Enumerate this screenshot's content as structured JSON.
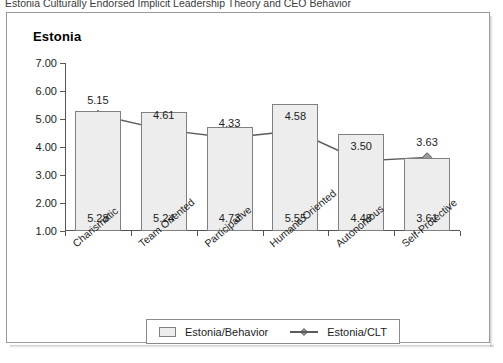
{
  "caption": "Estonia Culturally Endorsed Implicit Leadership Theory and CEO Behavior",
  "chart_data": {
    "type": "bar",
    "title": "Estonia",
    "xlabel": "",
    "ylabel": "",
    "ylim": [
      1.0,
      7.0
    ],
    "ytick_labels": [
      "7.00",
      "6.00",
      "5.00",
      "4.00",
      "3.00",
      "2.00",
      "1.00"
    ],
    "ytick_values": [
      7.0,
      6.0,
      5.0,
      4.0,
      3.0,
      2.0,
      1.0
    ],
    "grid": false,
    "legend_position": "bottom",
    "categories": [
      "Charismatic",
      "Team Oriented",
      "Participative",
      "Humane Oriented",
      "Autonomous",
      "Self-Protective"
    ],
    "series": [
      {
        "name": "Estonia/Behavior",
        "type": "bar",
        "values": [
          5.28,
          5.24,
          4.73,
          5.55,
          4.48,
          3.61
        ],
        "labels": [
          "5.28",
          "5.24",
          "4.73",
          "5.55",
          "4.48",
          "3.61"
        ],
        "fill_color": "#ededed",
        "border_color": "#808080"
      },
      {
        "name": "Estonia/CLT",
        "type": "line",
        "values": [
          5.15,
          4.61,
          4.33,
          4.58,
          3.5,
          3.63
        ],
        "labels": [
          "5.15",
          "4.61",
          "4.33",
          "4.58",
          "3.50",
          "3.63"
        ],
        "line_color": "#5a5a5a",
        "marker": "diamond",
        "marker_color": "#9a9a9a"
      }
    ]
  }
}
